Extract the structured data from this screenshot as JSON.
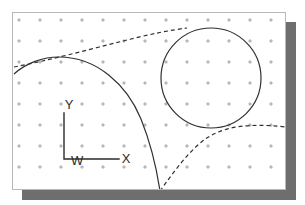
{
  "panel": {
    "background_color": "#ffffff",
    "border_color": "#b8b8b8",
    "shadow_color": "#6e6e6e"
  },
  "grid": {
    "marker_glyph": "+",
    "marker_color": "#999999",
    "spacing_px": 21,
    "origin_x_px": 18,
    "origin_y_px": 19,
    "columns": 13,
    "rows": 9
  },
  "coordinate_frame": {
    "name": "W",
    "origin_label": "W",
    "y_axis_label": "Y",
    "x_axis_label": "X",
    "axis_color": "#2b2b2b",
    "origin_px": [
      63,
      158
    ],
    "y_tip_px": [
      63,
      112
    ],
    "x_tip_px": [
      118,
      158
    ]
  },
  "chart_data": {
    "type": "line",
    "title": "",
    "xlabel": "X",
    "ylabel": "Y",
    "grid": true,
    "legend": "none",
    "series": [
      {
        "name": "large-arc",
        "style": "solid",
        "color": "#303030",
        "description": "large circular arc entering at left edge, peaking near top-left, sweeping down to bottom edge",
        "path": "M 13,73 C 25,62 42,56 58,56 C 96,56 126,84 140,118 C 150,143 156,170 159,190"
      },
      {
        "name": "circle",
        "style": "solid",
        "color": "#303030",
        "description": "circle tangent to the large arc and to the dashed curves",
        "center_px": [
          210,
          77
        ],
        "radius_px": 50
      },
      {
        "name": "upper-dashed-tangent",
        "style": "dashed",
        "color": "#303030",
        "description": "dashed common tangent from left running up-right to top of circle",
        "path": "M 13,66 C 45,60 90,48 130,38 C 150,33 170,29 186,27"
      },
      {
        "name": "lower-dashed-tangent",
        "style": "dashed",
        "color": "#303030",
        "description": "dashed curve rising from bottom-left, tangent under the circle, exiting at right edge",
        "path": "M 159,190 C 172,172 186,152 203,139 C 222,125 248,122 285,126"
      }
    ]
  }
}
